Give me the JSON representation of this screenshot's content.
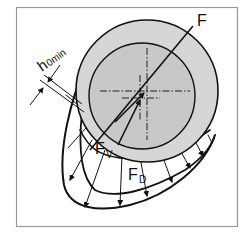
{
  "diagram": {
    "type": "journal-bearing-pressure-distribution",
    "labels": {
      "force_total": "F",
      "force_v": "F",
      "force_v_sub": "V",
      "force_d": "F",
      "force_d_sub": "D",
      "min_gap": "h",
      "min_gap_sub": "0min"
    },
    "colors": {
      "frame": "#9a9a9a",
      "bearing_fill": "#d6d6d6",
      "shaft_fill": "#c8c8c8",
      "line": "#111111",
      "background": "#ffffff"
    },
    "elements": [
      "outer-bearing-circle",
      "inner-shaft-circle",
      "center-crosshairs",
      "resultant-force-line-F",
      "force-arrow-Fv",
      "force-arrow-Fd",
      "minimum-gap-dimension-h0min",
      "hydrodynamic-pressure-distribution"
    ]
  }
}
